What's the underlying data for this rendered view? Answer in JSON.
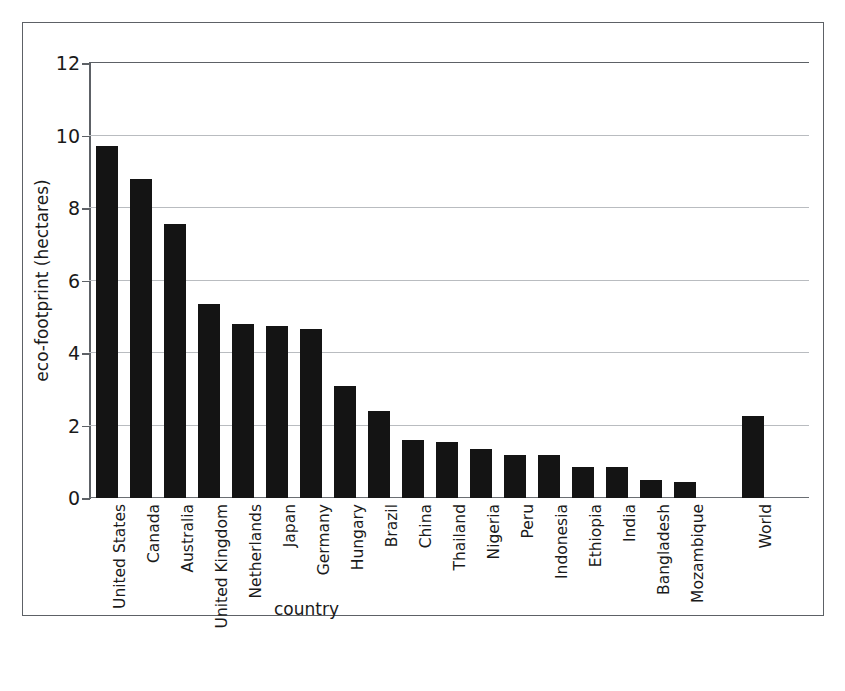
{
  "chart_data": {
    "type": "bar",
    "title": "",
    "xlabel": "country",
    "ylabel": "eco-footprint (hectares)",
    "ylim": [
      0,
      12
    ],
    "yticks": [
      0,
      2,
      4,
      6,
      8,
      10,
      12
    ],
    "ytick_labels": [
      "0",
      "2",
      "4",
      "6",
      "8",
      "10",
      "12"
    ],
    "grid": true,
    "legend": false,
    "bar_color": "#141414",
    "gap_before_last_category": true,
    "categories": [
      "United States",
      "Canada",
      "Australia",
      "United Kingdom",
      "Netherlands",
      "Japan",
      "Germany",
      "Hungary",
      "Brazil",
      "China",
      "Thailand",
      "Nigeria",
      "Peru",
      "Indonesia",
      "Ethiopia",
      "India",
      "Bangladesh",
      "Mozambique",
      "World"
    ],
    "values": [
      9.7,
      8.8,
      7.55,
      5.35,
      4.8,
      4.75,
      4.65,
      3.1,
      2.4,
      1.6,
      1.55,
      1.35,
      1.2,
      1.2,
      0.85,
      0.85,
      0.5,
      0.45,
      2.25
    ]
  }
}
